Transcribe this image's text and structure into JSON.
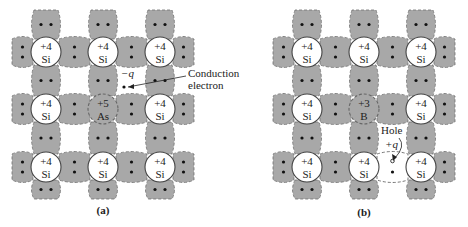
{
  "panels": [
    {
      "id": "a",
      "caption": "(a)",
      "atoms": [
        [
          {
            "charge": "+4",
            "symbol": "Si"
          },
          {
            "charge": "+4",
            "symbol": "Si"
          },
          {
            "charge": "+4",
            "symbol": "Si"
          }
        ],
        [
          {
            "charge": "+4",
            "symbol": "Si"
          },
          {
            "charge": "+5",
            "symbol": "As",
            "impurity": true
          },
          {
            "charge": "+4",
            "symbol": "Si"
          }
        ],
        [
          {
            "charge": "+4",
            "symbol": "Si"
          },
          {
            "charge": "+4",
            "symbol": "Si"
          },
          {
            "charge": "+4",
            "symbol": "Si"
          }
        ]
      ],
      "annotations": {
        "charge_label": "−q",
        "label_line1": "Conduction",
        "label_line2": "electron"
      }
    },
    {
      "id": "b",
      "caption": "(b)",
      "atoms": [
        [
          {
            "charge": "+4",
            "symbol": "Si"
          },
          {
            "charge": "+4",
            "symbol": "Si"
          },
          {
            "charge": "+4",
            "symbol": "Si"
          }
        ],
        [
          {
            "charge": "+4",
            "symbol": "Si"
          },
          {
            "charge": "+3",
            "symbol": "B",
            "impurity": true
          },
          {
            "charge": "+4",
            "symbol": "Si"
          }
        ],
        [
          {
            "charge": "+4",
            "symbol": "Si"
          },
          {
            "charge": "+4",
            "symbol": "Si"
          },
          {
            "charge": "+4",
            "symbol": "Si"
          }
        ]
      ],
      "annotations": {
        "label_line1": "Hole",
        "charge_label": "+q"
      }
    }
  ]
}
